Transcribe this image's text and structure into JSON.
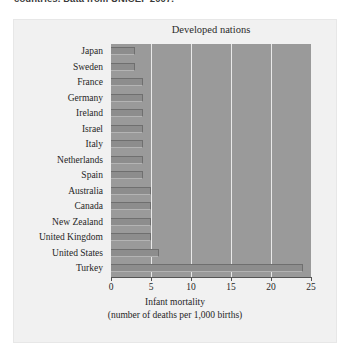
{
  "caption": {
    "text": "countries. Data from UNICEF 2007."
  },
  "figure": {
    "title": "Developed nations"
  },
  "axis": {
    "x_label_line1": "Infant mortality",
    "x_label_line2": "(number of deaths per 1,000 births)",
    "x_ticks": [
      "0",
      "5",
      "10",
      "15",
      "20",
      "25"
    ]
  },
  "chart_data": {
    "type": "bar",
    "orientation": "horizontal",
    "title": "Developed nations",
    "xlabel": "Infant mortality (number of deaths per 1,000 births)",
    "ylabel": "",
    "xlim": [
      0,
      25
    ],
    "xticks": [
      0,
      5,
      10,
      15,
      20,
      25
    ],
    "grid": true,
    "grid_axis": "x",
    "legend": false,
    "categories": [
      "Japan",
      "Sweden",
      "France",
      "Germany",
      "Ireland",
      "Israel",
      "Italy",
      "Netherlands",
      "Spain",
      "Australia",
      "Canada",
      "New Zealand",
      "United Kingdom",
      "United States",
      "Turkey"
    ],
    "values": [
      3,
      3,
      4,
      4,
      4,
      4,
      4,
      4,
      4,
      5,
      5,
      5,
      5,
      6,
      24
    ],
    "bar_color": "#8d8d8d",
    "plot_background": "#9a9a9a",
    "panel_background": "#f1f1f1"
  }
}
